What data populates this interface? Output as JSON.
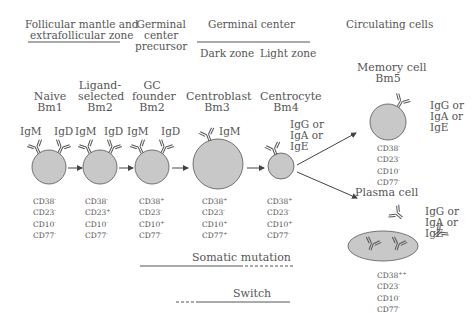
{
  "header": {
    "zone1": [
      "Follicular mantle and",
      "extrafollicular zone"
    ],
    "zone2": [
      "Germinal",
      "center",
      "precursor"
    ],
    "zone3": "Germinal center",
    "zone3_sub": [
      "Dark zone",
      "Light zone"
    ],
    "zone4": "Circulating cells"
  },
  "stages": [
    {
      "name": [
        "Naive",
        "Bm1"
      ],
      "ig": [
        "IgM",
        "IgD"
      ],
      "cd": [
        [
          "CD38",
          "-"
        ],
        [
          "CD23",
          "-"
        ],
        [
          "CD10",
          "-"
        ],
        [
          "CD77",
          "-"
        ]
      ]
    },
    {
      "name": [
        "Ligand-",
        "selected",
        "Bm2"
      ],
      "ig": [
        "IgM",
        "IgD"
      ],
      "cd": [
        [
          "CD38",
          "-"
        ],
        [
          "CD23",
          "+"
        ],
        [
          "CD10",
          "-"
        ],
        [
          "CD77",
          "-"
        ]
      ]
    },
    {
      "name": [
        "GC",
        "founder",
        "Bm2"
      ],
      "ig": [
        "IgM",
        "IgD"
      ],
      "cd": [
        [
          "CD38",
          "+"
        ],
        [
          "CD23",
          "-"
        ],
        [
          "CD10",
          "+"
        ],
        [
          "CD77",
          "-"
        ]
      ]
    },
    {
      "name": [
        "Centroblast",
        "Bm3"
      ],
      "ig": [
        "IgM"
      ],
      "cd": [
        [
          "CD38",
          "+"
        ],
        [
          "CD23",
          "-"
        ],
        [
          "CD10",
          "+"
        ],
        [
          "CD77",
          "+"
        ]
      ]
    },
    {
      "name": [
        "Centrocyte",
        "Bm4"
      ],
      "ig": [
        "IgG or",
        "IgA or",
        "IgE"
      ],
      "cd": [
        [
          "CD38",
          "+"
        ],
        [
          "CD23",
          "-"
        ],
        [
          "CD10",
          "+"
        ],
        [
          "CD77",
          "-"
        ]
      ]
    },
    {
      "name": [
        "Memory cell",
        "Bm5"
      ],
      "ig": [
        "IgG or",
        "IgA or",
        "IgE"
      ],
      "cd": [
        [
          "CD38",
          "-"
        ],
        [
          "CD23",
          "-"
        ],
        [
          "CD10",
          "-"
        ],
        [
          "CD77",
          "-"
        ]
      ]
    },
    {
      "name": [
        "Plasma cell"
      ],
      "ig": [
        "IgG or",
        "IgA or",
        "IgE"
      ],
      "cd": [
        [
          "CD38",
          "++"
        ],
        [
          "CD23",
          "-"
        ],
        [
          "CD10",
          "-"
        ],
        [
          "CD77",
          "-"
        ]
      ]
    }
  ],
  "processes": {
    "somatic_mutation": "Somatic mutation",
    "switch": "Switch"
  },
  "colors": {
    "cell_fill": "#c8c8c8",
    "line": "#555555",
    "text": "#555555"
  }
}
